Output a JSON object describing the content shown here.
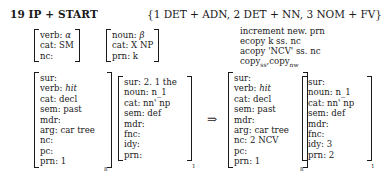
{
  "rule": {
    "title": "19 IP + START",
    "pattern": "{1 DET + ADN, 2 DET + NN, 3 NOM + FV}",
    "operations": [
      "increment new. prn",
      "ecopy k ss. nc",
      "acopy 'NCV' ss. nc"
    ],
    "copy_line": {
      "a": "copy",
      "a_sub": "ss",
      "b": "copy",
      "b_sub": "nw"
    }
  },
  "pattern_left": [
    {
      "attr": "verb",
      "value": "α"
    },
    {
      "attr": "cat",
      "value": "SM"
    },
    {
      "attr": "nc",
      "value": ""
    }
  ],
  "pattern_right": [
    {
      "attr": "noun",
      "value": "β"
    },
    {
      "attr": "cat",
      "value": "X NP"
    },
    {
      "attr": "prn",
      "value": "k"
    }
  ],
  "input_verb": {
    "subscript": "8",
    "rows": [
      {
        "attr": "sur",
        "value": ""
      },
      {
        "attr": "verb",
        "value": "hit"
      },
      {
        "attr": "cat",
        "value": "decl"
      },
      {
        "attr": "sem",
        "value": "past"
      },
      {
        "attr": "mdr",
        "value": ""
      },
      {
        "attr": "arg",
        "value": "car tree"
      },
      {
        "attr": "nc",
        "value": ""
      },
      {
        "attr": "pc",
        "value": ""
      },
      {
        "attr": "prn",
        "value": "1"
      }
    ]
  },
  "input_noun": {
    "subscript": "1",
    "rows": [
      {
        "attr": "sur",
        "value": "2. 1 the"
      },
      {
        "attr": "noun",
        "value": "n_1"
      },
      {
        "attr": "cat",
        "value": "nn' np"
      },
      {
        "attr": "sem",
        "value": "def"
      },
      {
        "attr": "mdr",
        "value": ""
      },
      {
        "attr": "fnc",
        "value": ""
      },
      {
        "attr": "idy",
        "value": ""
      },
      {
        "attr": "prn",
        "value": ""
      }
    ]
  },
  "arrow": "⇒",
  "output_verb": {
    "subscript": "8",
    "rows": [
      {
        "attr": "sur",
        "value": ""
      },
      {
        "attr": "verb",
        "value": "hit"
      },
      {
        "attr": "cat",
        "value": "decl"
      },
      {
        "attr": "sem",
        "value": "past"
      },
      {
        "attr": "mdr",
        "value": ""
      },
      {
        "attr": "arg",
        "value": "car tree"
      },
      {
        "attr": "nc",
        "value": "2 NCV"
      },
      {
        "attr": "pc",
        "value": ""
      },
      {
        "attr": "prn",
        "value": "1"
      }
    ]
  },
  "output_noun": {
    "subscript": "1",
    "rows": [
      {
        "attr": "sur",
        "value": ""
      },
      {
        "attr": "noun",
        "value": "n_1"
      },
      {
        "attr": "cat",
        "value": "nn' np"
      },
      {
        "attr": "sem",
        "value": "def"
      },
      {
        "attr": "mdr",
        "value": ""
      },
      {
        "attr": "fnc",
        "value": ""
      },
      {
        "attr": "idy",
        "value": "3"
      },
      {
        "attr": "prn",
        "value": "2"
      }
    ]
  }
}
